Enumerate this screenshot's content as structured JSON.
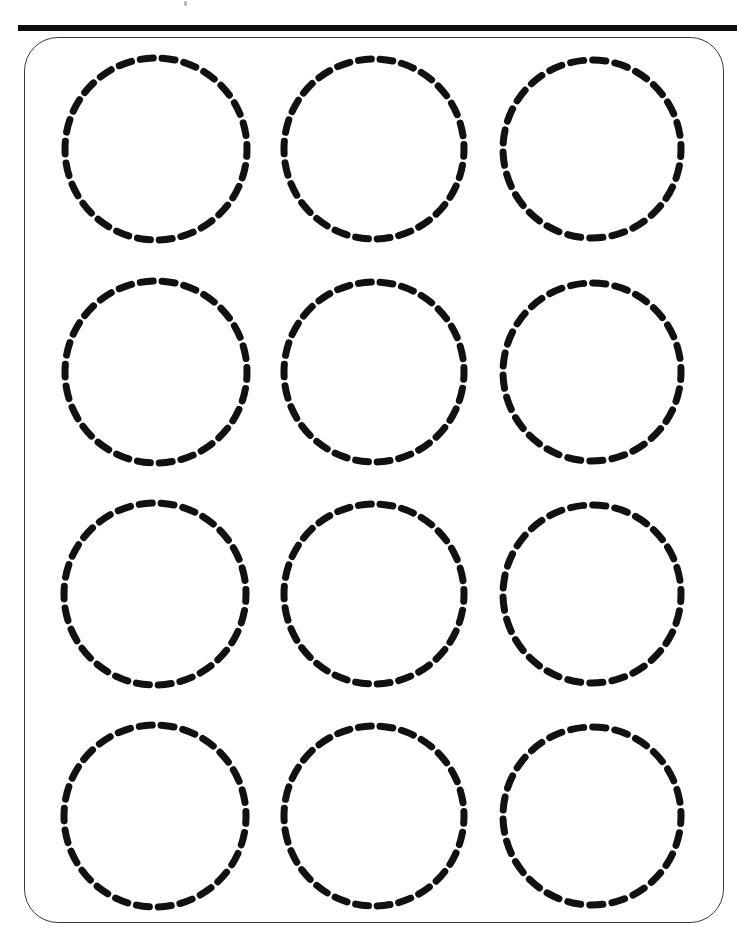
{
  "document": {
    "title": "Circle Tracing Practice Worksheet",
    "type": "tracing-worksheet",
    "page_width": 745,
    "page_height": 934,
    "background_color": "#ffffff",
    "ink_color": "#111111",
    "frame_color": "#3a3a3a",
    "rule_color": "#0d0d0d"
  },
  "top_rule": {
    "name": "header-rule",
    "x": 18,
    "y": 25,
    "width": 719,
    "height": 6,
    "color": "#0d0d0d"
  },
  "scan_speck": {
    "name": "scan-artifact",
    "x": 184,
    "y": 1,
    "color": "#b9b9b9"
  },
  "frame": {
    "name": "worksheet-frame",
    "x": 24,
    "y": 37,
    "width": 700,
    "height": 886,
    "corner_radius": 34,
    "stroke_width": 1.3,
    "color": "#3a3a3a"
  },
  "grid": {
    "rows": 4,
    "columns": 3,
    "total_circles": 12,
    "stroke_width": 7,
    "dash_length": 13,
    "gap_length": 9
  },
  "circles": [
    {
      "id": "circle-r1c1",
      "row": 1,
      "col": 1,
      "cx": 156,
      "cy": 149,
      "r": 91
    },
    {
      "id": "circle-r1c2",
      "row": 1,
      "col": 2,
      "cx": 374,
      "cy": 149,
      "r": 90
    },
    {
      "id": "circle-r1c3",
      "row": 1,
      "col": 3,
      "cx": 592,
      "cy": 149,
      "r": 89
    },
    {
      "id": "circle-r2c1",
      "row": 2,
      "col": 1,
      "cx": 156,
      "cy": 372,
      "r": 91
    },
    {
      "id": "circle-r2c2",
      "row": 2,
      "col": 2,
      "cx": 374,
      "cy": 372,
      "r": 90
    },
    {
      "id": "circle-r2c3",
      "row": 2,
      "col": 3,
      "cx": 592,
      "cy": 372,
      "r": 89
    },
    {
      "id": "circle-r3c1",
      "row": 3,
      "col": 1,
      "cx": 155,
      "cy": 594,
      "r": 91
    },
    {
      "id": "circle-r3c2",
      "row": 3,
      "col": 2,
      "cx": 374,
      "cy": 594,
      "r": 90
    },
    {
      "id": "circle-r3c3",
      "row": 3,
      "col": 3,
      "cx": 592,
      "cy": 594,
      "r": 89
    },
    {
      "id": "circle-r4c1",
      "row": 4,
      "col": 1,
      "cx": 155,
      "cy": 816,
      "r": 91
    },
    {
      "id": "circle-r4c2",
      "row": 4,
      "col": 2,
      "cx": 374,
      "cy": 816,
      "r": 90
    },
    {
      "id": "circle-r4c3",
      "row": 4,
      "col": 3,
      "cx": 592,
      "cy": 816,
      "r": 89
    }
  ]
}
